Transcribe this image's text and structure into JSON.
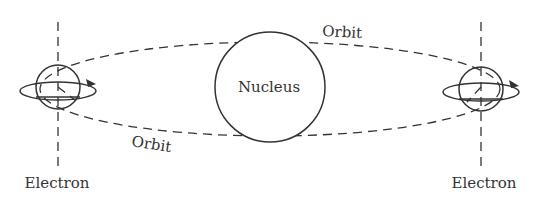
{
  "diagram": {
    "type": "atomic-orbit-schematic",
    "labels": {
      "nucleus": "Nucleus",
      "orbit_top": "Orbit",
      "orbit_bottom": "Orbit",
      "electron_left": "Electron",
      "electron_right": "Electron"
    },
    "colors": {
      "line": "#333333",
      "background": "#ffffff"
    }
  }
}
